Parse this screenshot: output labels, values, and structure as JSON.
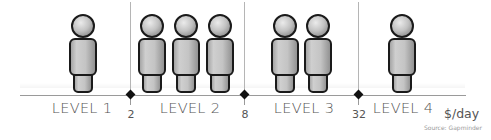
{
  "diagram": {
    "title": "",
    "unit_label": "$/day",
    "source": "Source: Gapminder",
    "colors": {
      "figure_fill": "#bdbdbd",
      "figure_outline": "#1a1a1a",
      "axis": "#9a9a9a",
      "divider": "#b5b5b5",
      "marker": "#111111",
      "label": "#555555"
    },
    "thresholds": [
      {
        "value": "2",
        "x": 130
      },
      {
        "value": "8",
        "x": 244
      },
      {
        "value": "32",
        "x": 358
      }
    ],
    "levels": [
      {
        "label": "LEVEL 1",
        "people": 1,
        "label_x": 82,
        "figure_x": [
          83
        ]
      },
      {
        "label": "LEVEL 2",
        "people": 3,
        "label_x": 190,
        "figure_x": [
          152,
          186,
          220
        ]
      },
      {
        "label": "LEVEL 3",
        "people": 2,
        "label_x": 304,
        "figure_x": [
          285,
          318
        ]
      },
      {
        "label": "LEVEL 4",
        "people": 1,
        "label_x": 403,
        "figure_x": [
          402
        ]
      }
    ],
    "icons": {
      "person": "person-icon",
      "threshold_marker": "diamond-marker-icon"
    }
  }
}
